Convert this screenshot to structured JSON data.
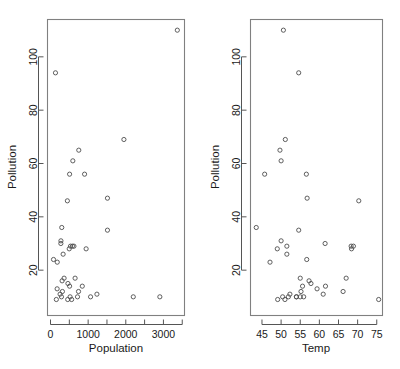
{
  "figure": {
    "background": "#ffffff",
    "frame_color": "#808080",
    "point_color": "#4d4d4d",
    "text_color": "#1a1a1a",
    "panel_count": 2
  },
  "chart_data": [
    {
      "type": "scatter",
      "title": "",
      "xlabel": "Population",
      "ylabel": "Pollution",
      "xlim": [
        -80,
        3560
      ],
      "ylim": [
        3,
        114
      ],
      "grid": false,
      "legend": null,
      "xticks": [
        0,
        1000,
        2000,
        3000
      ],
      "xticks_minor": [
        500,
        1500,
        2500,
        3500
      ],
      "yticks": [
        20,
        40,
        60,
        80,
        100
      ],
      "marker": "open-circle",
      "x": [
        448,
        1233,
        80,
        2905,
        361,
        155,
        291,
        593,
        335,
        3369,
        497,
        905,
        507,
        622,
        1064,
        179,
        1513,
        744,
        507,
        717,
        751,
        582,
        132,
        2199,
        277,
        844,
        176,
        316,
        531,
        457,
        946,
        299,
        463,
        1950,
        520,
        308,
        1513,
        653,
        254,
        561,
        275
      ],
      "y": [
        46,
        11,
        24,
        10,
        17,
        9,
        10,
        61,
        26,
        110,
        28,
        56,
        14,
        29,
        10,
        23,
        35,
        12,
        56,
        10,
        65,
        29,
        94,
        10,
        31,
        14,
        13,
        12,
        29,
        9,
        28,
        36,
        15,
        69,
        10,
        16,
        47,
        17,
        11,
        9,
        30
      ],
      "n_points": 41
    },
    {
      "type": "scatter",
      "title": "",
      "xlabel": "Temp",
      "ylabel": "Pollution",
      "xlim": [
        42,
        76.5
      ],
      "ylim": [
        3,
        114
      ],
      "grid": false,
      "legend": null,
      "xticks": [
        45,
        50,
        55,
        60,
        65,
        70,
        75
      ],
      "yticks": [
        20,
        40,
        60,
        80,
        100
      ],
      "marker": "open-circle",
      "x": [
        70.3,
        61.0,
        56.7,
        51.9,
        55.0,
        49.1,
        54.0,
        50.0,
        51.5,
        50.6,
        49.0,
        56.6,
        55.6,
        68.3,
        55.0,
        47.1,
        54.6,
        55.2,
        45.7,
        54.0,
        49.7,
        51.5,
        54.6,
        50.4,
        50.0,
        61.6,
        59.4,
        66.2,
        68.9,
        51.0,
        68.4,
        43.5,
        57.8,
        51.1,
        55.9,
        57.3,
        56.8,
        67.0,
        52.3,
        75.5,
        61.5
      ],
      "y": [
        46,
        11,
        24,
        10,
        17,
        9,
        10,
        61,
        26,
        110,
        28,
        56,
        14,
        29,
        10,
        23,
        35,
        12,
        56,
        10,
        65,
        29,
        94,
        10,
        31,
        14,
        13,
        12,
        29,
        9,
        28,
        36,
        15,
        69,
        10,
        16,
        47,
        17,
        11,
        9,
        30
      ],
      "n_points": 41
    }
  ]
}
